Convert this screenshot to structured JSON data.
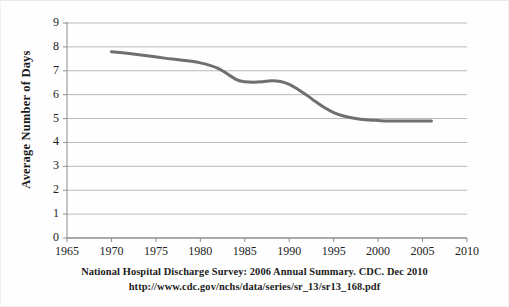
{
  "figure": {
    "caption_line1": "National Hospital Discharge Survey: 2006 Annual Summary.   CDC.  Dec 2010",
    "caption_line2": "http://www.cdc.gov/nchs/data/series/sr_13/sr13_168.pdf"
  },
  "chart_data": {
    "type": "line",
    "title": "",
    "xlabel": "",
    "ylabel": "Average Number of Days",
    "xlim": [
      1965,
      2010
    ],
    "ylim": [
      0,
      9
    ],
    "xticks": [
      "1965",
      "1970",
      "1975",
      "1980",
      "1985",
      "1990",
      "1995",
      "2000",
      "2005",
      "2010"
    ],
    "yticks": [
      "0",
      "1",
      "2",
      "3",
      "4",
      "5",
      "6",
      "7",
      "8",
      "9"
    ],
    "grid": "horizontal",
    "legend": "none",
    "line_color": "#6f6f6f",
    "line_width": 3,
    "x": [
      1970,
      1972,
      1974,
      1976,
      1978,
      1980,
      1982,
      1984,
      1985,
      1986,
      1987,
      1988,
      1989,
      1990,
      1991,
      1992,
      1993,
      1994,
      1995,
      1996,
      1997,
      1998,
      1999,
      2000,
      2001,
      2002,
      2003,
      2004,
      2005,
      2006
    ],
    "values": [
      7.8,
      7.72,
      7.63,
      7.53,
      7.44,
      7.33,
      7.1,
      6.64,
      6.54,
      6.52,
      6.54,
      6.58,
      6.55,
      6.43,
      6.22,
      5.97,
      5.7,
      5.45,
      5.25,
      5.12,
      5.03,
      4.97,
      4.94,
      4.92,
      4.9,
      4.9,
      4.9,
      4.9,
      4.9,
      4.9
    ]
  }
}
